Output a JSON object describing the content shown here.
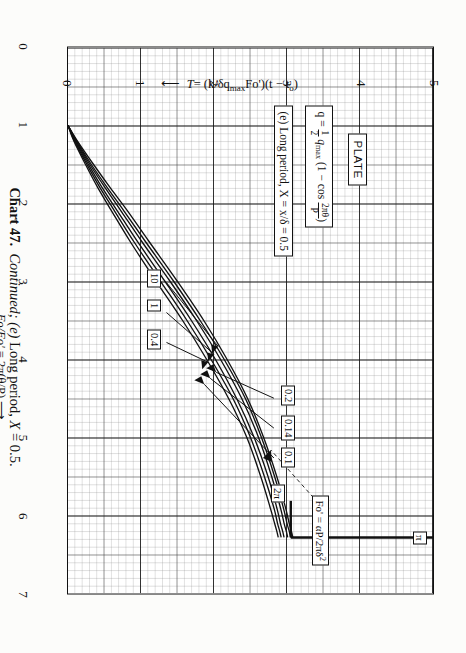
{
  "caption": {
    "number": "Chart 47.",
    "continued": "Continued;",
    "part": "(e)",
    "text": "Long period,",
    "variable": "X",
    "equals": "= 0.5."
  },
  "axes": {
    "x": {
      "label_main": "Fo/Fo'",
      "label_eq": "= 2π(θ/P)",
      "ticks": [
        "0",
        "1",
        "2",
        "3",
        "4",
        "5",
        "6",
        "7"
      ],
      "min": 0,
      "max": 7,
      "arrow": "⟶"
    },
    "y": {
      "label_main": "T",
      "label_eq": "= (k/δq",
      "label_sub": "max",
      "label_eq2": "Fo')(t − t",
      "label_sub2": "o",
      "label_end": ")",
      "ticks": [
        "0",
        "1",
        "2",
        "3",
        "4",
        "5"
      ],
      "min": 0,
      "max": 5,
      "arrow": "⟵"
    }
  },
  "annotations": {
    "plate": "PLATE",
    "equation_lhs": "q = ",
    "equation_half": "1/2",
    "equation_q": "q",
    "equation_qsub": "max",
    "equation_paren": "(1 − cos ",
    "equation_frac_n": "2πθ",
    "equation_frac_d": "P",
    "equation_close": ")",
    "case": "(e) Long period, X = x/δ = 0.5",
    "fo_def": "Fo' = αP/2πδ",
    "fo_def_sup": "2",
    "pi_label": "π",
    "two_pi_label": "2π"
  },
  "chart_data": {
    "type": "line",
    "subtitle": "PLATE — q = ½ q_max (1 − cos 2πθ/P); (e) Long period, X = x/δ = 0.5",
    "xlabel": "Fo/Fo' = 2π(θ/P)",
    "ylabel": "T = (k/δq_max Fo')(t − t_o)",
    "xlim": [
      0,
      7
    ],
    "ylim": [
      0,
      5
    ],
    "grid": true,
    "legend_position": "inline-callouts",
    "legend_title": "Fo' = αP/2πδ²",
    "vertical_asymptote": {
      "x": 6.283,
      "label": "π",
      "tick_label": "2π",
      "tick_x": 6.283,
      "tick_y": 3.05
    },
    "series": [
      {
        "name": "10",
        "x": [
          1.0,
          1.2,
          1.5,
          1.8,
          2.1,
          2.5,
          3.0,
          3.5,
          4.0,
          4.5,
          5.0,
          5.5,
          5.9,
          6.1,
          6.2,
          6.28
        ],
        "y": [
          0.0,
          0.13,
          0.35,
          0.58,
          0.82,
          1.12,
          1.5,
          1.86,
          2.18,
          2.46,
          2.68,
          2.86,
          2.98,
          3.03,
          3.06,
          3.08
        ]
      },
      {
        "name": "1",
        "x": [
          1.0,
          1.2,
          1.5,
          1.8,
          2.1,
          2.5,
          3.0,
          3.5,
          4.0,
          4.5,
          5.0,
          5.5,
          5.9,
          6.1,
          6.2,
          6.28
        ],
        "y": [
          0.0,
          0.12,
          0.32,
          0.54,
          0.77,
          1.07,
          1.45,
          1.81,
          2.14,
          2.43,
          2.65,
          2.83,
          2.95,
          3.0,
          3.03,
          3.05
        ]
      },
      {
        "name": "0.4",
        "x": [
          1.0,
          1.2,
          1.5,
          1.8,
          2.1,
          2.5,
          3.0,
          3.5,
          4.0,
          4.5,
          5.0,
          5.5,
          5.9,
          6.1,
          6.2,
          6.28
        ],
        "y": [
          0.0,
          0.11,
          0.3,
          0.51,
          0.73,
          1.02,
          1.4,
          1.76,
          2.09,
          2.38,
          2.61,
          2.79,
          2.91,
          2.96,
          2.99,
          3.01
        ]
      },
      {
        "name": "0.2",
        "x": [
          1.0,
          1.2,
          1.5,
          1.8,
          2.1,
          2.5,
          3.0,
          3.5,
          4.0,
          4.5,
          5.0,
          5.5,
          5.9,
          6.1,
          6.2,
          6.28
        ],
        "y": [
          0.0,
          0.1,
          0.28,
          0.47,
          0.68,
          0.96,
          1.33,
          1.69,
          2.02,
          2.31,
          2.55,
          2.74,
          2.86,
          2.91,
          2.94,
          2.96
        ]
      },
      {
        "name": "0.14",
        "x": [
          1.0,
          1.2,
          1.5,
          1.8,
          2.1,
          2.5,
          3.0,
          3.5,
          4.0,
          4.5,
          5.0,
          5.5,
          5.9,
          6.1,
          6.2,
          6.28
        ],
        "y": [
          0.0,
          0.09,
          0.26,
          0.44,
          0.64,
          0.91,
          1.27,
          1.63,
          1.96,
          2.26,
          2.5,
          2.69,
          2.82,
          2.87,
          2.9,
          2.92
        ]
      },
      {
        "name": "0.1",
        "x": [
          1.0,
          1.2,
          1.5,
          1.8,
          2.1,
          2.5,
          3.0,
          3.5,
          4.0,
          4.5,
          5.0,
          5.5,
          5.9,
          6.1,
          6.2,
          6.28
        ],
        "y": [
          0.0,
          0.08,
          0.24,
          0.41,
          0.6,
          0.86,
          1.21,
          1.57,
          1.9,
          2.2,
          2.45,
          2.64,
          2.77,
          2.83,
          2.86,
          2.88
        ]
      }
    ],
    "callouts_left": [
      "10",
      "1",
      "0.4"
    ],
    "callouts_right": [
      "0.2",
      "0.14",
      "0.1"
    ]
  }
}
